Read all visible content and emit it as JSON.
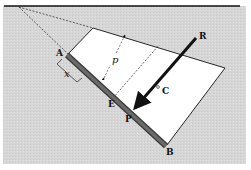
{
  "figure": {
    "type": "hydrostatic force on inclined submerged plate",
    "labels": {
      "A": "A",
      "B": "B",
      "C": "C",
      "E": "E",
      "P": "P",
      "R": "R",
      "x": "x",
      "p": "p"
    },
    "colors": {
      "fluid": "#d9d9d9",
      "pressure_region": "#ffffff",
      "plate": "#555555",
      "lines": "#1a1a1a"
    }
  }
}
